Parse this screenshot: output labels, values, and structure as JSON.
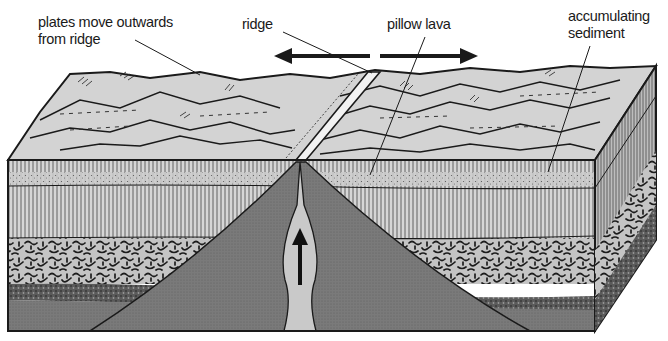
{
  "diagram": {
    "labels": {
      "plates_line1": "plates move outwards",
      "plates_line2": "from ridge",
      "ridge": "ridge",
      "pillow_lava": "pillow lava",
      "sediment_line1": "accumulating",
      "sediment_line2": "sediment"
    },
    "arrows": [
      {
        "name": "plate-motion-left",
        "direction": "left"
      },
      {
        "name": "plate-motion-right",
        "direction": "right"
      },
      {
        "name": "magma-upwelling",
        "direction": "up"
      }
    ],
    "layers": [
      "sea floor surface with sediment",
      "pillow lava / sediment band",
      "sheeted dykes",
      "gabbro",
      "peridotite",
      "mantle",
      "magma conduit"
    ],
    "colors": {
      "surface": "#d4d4d4",
      "sediment_band": "#c8c8c8",
      "dyke_band": "#cfcfcf",
      "gabbro": "#bdbdbd",
      "peridotite": "#6e6e6e",
      "mantle": "#7d7d7d",
      "magma": "#c9c9c9",
      "ink": "#1a1a1a"
    }
  }
}
